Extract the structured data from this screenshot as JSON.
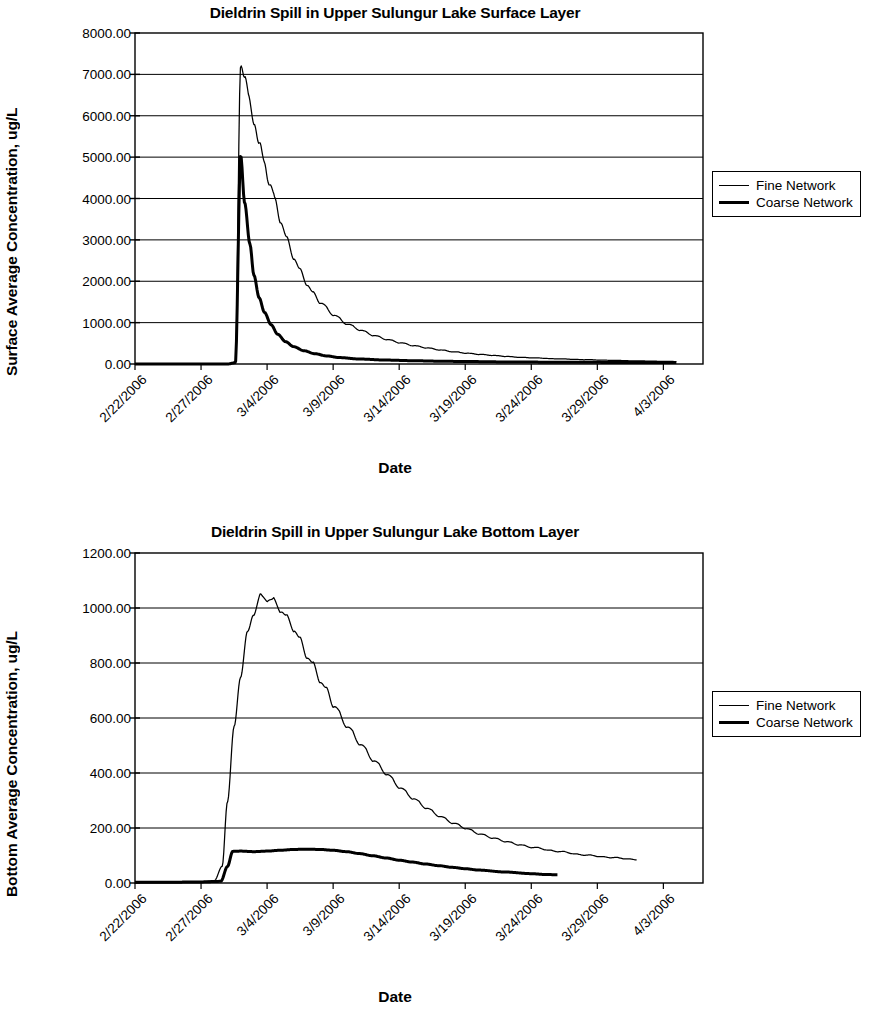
{
  "figures": [
    {
      "id": "surface",
      "title": "Dieldrin Spill in Upper Sulungur Lake Surface Layer",
      "ylabel": "Surface Average Concentration, ug/L",
      "xlabel": "Date",
      "yticks": [
        "8000.00",
        "7000.00",
        "6000.00",
        "5000.00",
        "4000.00",
        "3000.00",
        "2000.00",
        "1000.00",
        "0.00"
      ],
      "xticks": [
        "2/22/2006",
        "2/27/2006",
        "3/4/2006",
        "3/9/2006",
        "3/14/2006",
        "3/19/2006",
        "3/24/2006",
        "3/29/2006",
        "4/3/2006"
      ],
      "legend": [
        {
          "name": "Fine Network",
          "style": "fine"
        },
        {
          "name": "Coarse Network",
          "style": "coarse"
        }
      ]
    },
    {
      "id": "bottom",
      "title": "Dieldrin Spill in Upper Sulungur Lake Bottom Layer",
      "ylabel": "Bottom Average Concentration, ug/L",
      "xlabel": "Date",
      "yticks": [
        "1200.00",
        "1000.00",
        "800.00",
        "600.00",
        "400.00",
        "200.00",
        "0.00"
      ],
      "xticks": [
        "2/22/2006",
        "2/27/2006",
        "3/4/2006",
        "3/9/2006",
        "3/14/2006",
        "3/19/2006",
        "3/24/2006",
        "3/29/2006",
        "4/3/2006"
      ],
      "legend": [
        {
          "name": "Fine Network",
          "style": "fine"
        },
        {
          "name": "Coarse Network",
          "style": "coarse"
        }
      ]
    }
  ],
  "chart_data": [
    {
      "type": "line",
      "id": "surface",
      "title": "Dieldrin Spill in Upper Sulungur Lake Surface Layer",
      "xlabel": "Date",
      "ylabel": "Surface Average Concentration, ug/L",
      "grid": true,
      "legend_position": "right",
      "xlim": [
        "2/22/2006",
        "4/5/2006"
      ],
      "ylim": [
        0,
        8000
      ],
      "ytick_values": [
        0,
        1000,
        2000,
        3000,
        4000,
        5000,
        6000,
        7000,
        8000
      ],
      "xtick_labels": [
        "2/22/2006",
        "2/27/2006",
        "3/4/2006",
        "3/9/2006",
        "3/14/2006",
        "3/19/2006",
        "3/24/2006",
        "3/29/2006",
        "4/3/2006"
      ],
      "x_days_from_start": [
        0,
        5,
        10,
        15,
        20,
        25,
        30,
        35,
        40
      ],
      "series": [
        {
          "name": "Fine Network",
          "line_width": "thin",
          "color": "#000000",
          "note": "Near zero until the spill on 3/2/2006, sharp rise to a peak of about 7400 ug/L, then oscillating exponential decay with daily ripples, falling below 1000 by 3/11 and approaching near zero by 4/2.",
          "x_days": [
            0,
            2,
            4,
            6,
            7,
            7.6,
            8,
            8.3,
            8.6,
            9,
            9.4,
            9.8,
            10.2,
            10.6,
            11,
            11.5,
            12,
            12.5,
            13,
            13.5,
            14,
            15,
            16,
            17,
            18,
            19,
            20,
            21,
            22,
            23,
            24,
            25,
            26,
            27,
            28,
            29,
            30,
            32,
            34,
            36,
            38,
            40,
            41
          ],
          "y": [
            0,
            0,
            0,
            0,
            0,
            40,
            7400,
            6900,
            6400,
            5950,
            5250,
            4900,
            4350,
            3950,
            3500,
            3000,
            2600,
            2250,
            1950,
            1700,
            1500,
            1200,
            980,
            830,
            700,
            600,
            520,
            450,
            395,
            345,
            300,
            265,
            235,
            210,
            185,
            165,
            150,
            125,
            105,
            90,
            75,
            65,
            60
          ]
        },
        {
          "name": "Coarse Network",
          "line_width": "thick",
          "color": "#000000",
          "note": "Near zero until the spill on 3/2/2006, rises to about 5050 ug/L, then very rapid decay, below 1000 by 3/5 and essentially flat near zero from 3/8 onward.",
          "x_days": [
            0,
            2,
            4,
            6,
            7,
            7.6,
            8,
            8.3,
            8.7,
            9,
            9.4,
            9.8,
            10.3,
            10.8,
            11.4,
            12,
            12.8,
            13.6,
            14.5,
            15.5,
            17,
            19,
            21,
            23,
            25,
            28,
            31,
            34,
            37,
            40,
            41
          ],
          "y": [
            0,
            0,
            0,
            0,
            0,
            30,
            5050,
            3900,
            2900,
            2150,
            1600,
            1250,
            950,
            720,
            540,
            420,
            320,
            250,
            195,
            155,
            120,
            95,
            80,
            68,
            60,
            50,
            45,
            40,
            38,
            35,
            35
          ]
        }
      ]
    },
    {
      "type": "line",
      "id": "bottom",
      "title": "Dieldrin Spill in Upper Sulungur Lake Bottom Layer",
      "xlabel": "Date",
      "ylabel": "Bottom Average Concentration, ug/L",
      "grid": true,
      "legend_position": "right",
      "xlim": [
        "2/22/2006",
        "4/5/2006"
      ],
      "ylim": [
        0,
        1200
      ],
      "ytick_values": [
        0,
        200,
        400,
        600,
        800,
        1000,
        1200
      ],
      "xtick_labels": [
        "2/22/2006",
        "2/27/2006",
        "3/4/2006",
        "3/9/2006",
        "3/14/2006",
        "3/19/2006",
        "3/24/2006",
        "3/29/2006",
        "4/3/2006"
      ],
      "x_days_from_start": [
        0,
        5,
        10,
        15,
        20,
        25,
        30,
        35,
        40
      ],
      "series": [
        {
          "name": "Fine Network",
          "line_width": "thin",
          "color": "#000000",
          "note": "Flat near zero until 3/1, steep rise through 3/3-3/5 to a ripple-topped plateau peak near 1040 ug/L around 3/5-3/6, then a long oscillating decay reaching about 85 ug/L by 4/1 where the series ends.",
          "x_days": [
            0,
            3,
            5,
            6,
            6.6,
            7,
            7.5,
            8,
            8.5,
            9,
            9.5,
            10,
            10.5,
            11,
            11.5,
            12,
            12.5,
            13,
            13.5,
            14,
            14.5,
            15,
            16,
            17,
            18,
            19,
            20,
            21,
            22,
            23,
            24,
            25,
            26,
            27,
            28,
            29,
            30,
            32,
            34,
            36,
            38
          ],
          "y": [
            3,
            3,
            4,
            8,
            60,
            300,
            560,
            760,
            900,
            990,
            1035,
            1040,
            1020,
            1000,
            960,
            930,
            880,
            830,
            790,
            740,
            700,
            650,
            575,
            510,
            450,
            400,
            350,
            310,
            275,
            245,
            220,
            200,
            180,
            165,
            152,
            140,
            130,
            115,
            102,
            93,
            85
          ]
        },
        {
          "name": "Coarse Network",
          "line_width": "thick",
          "color": "#000000",
          "note": "Flat near zero until 3/1, jumps to about 115 ug/L on 3/2, gently rises to about 123 ug/L around 3/7, then slowly declines to roughly 30 ug/L by 3/26 where the series ends.",
          "x_days": [
            0,
            3,
            5,
            6.5,
            7,
            7.4,
            8,
            9,
            10,
            11,
            12,
            13,
            14,
            15,
            16,
            17,
            18,
            19,
            20,
            21,
            22,
            23,
            24,
            25,
            26,
            28,
            30,
            31,
            32
          ],
          "y": [
            3,
            3,
            4,
            6,
            60,
            115,
            116,
            114,
            116,
            119,
            122,
            123,
            122,
            119,
            114,
            107,
            99,
            91,
            83,
            76,
            69,
            63,
            57,
            52,
            47,
            40,
            34,
            31,
            30
          ]
        }
      ]
    }
  ]
}
